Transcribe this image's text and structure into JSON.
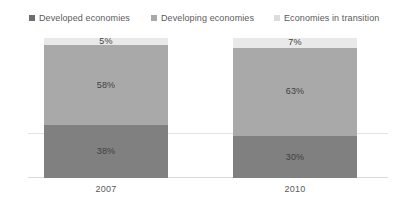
{
  "chart_data": {
    "type": "bar",
    "subtype": "100%-stacked-bar",
    "title": "",
    "subtitle": "",
    "xlabel": "",
    "ylabel": "",
    "categories": [
      "2007",
      "2010"
    ],
    "series": [
      {
        "name": "Developed economies",
        "values": [
          38,
          30
        ],
        "labels": [
          "38%",
          "30%"
        ],
        "color": "#808080",
        "swatch_color": "#6e6e6e"
      },
      {
        "name": "Developing economies",
        "values": [
          58,
          63
        ],
        "labels": [
          "58%",
          "63%"
        ],
        "color": "#a9a9a9",
        "swatch_color": "#a9a9a9"
      },
      {
        "name": "Economies in transition",
        "values": [
          5,
          7
        ],
        "labels": [
          "5%",
          "7%"
        ],
        "color": "#e9e9e9",
        "swatch_color": "#dcdcdc"
      }
    ],
    "stack_order_top_to_bottom": [
      "Economies in transition",
      "Developing economies",
      "Developed economies"
    ],
    "ylim": [
      0,
      100
    ],
    "grid": true,
    "gridlines_at": [
      50
    ],
    "legend_position": "top",
    "value_unit": "%"
  },
  "legend": {
    "items": [
      {
        "label": "Developed economies"
      },
      {
        "label": "Developing economies"
      },
      {
        "label": "Economies in transition"
      }
    ]
  },
  "colors": {
    "developed": "#808080",
    "developing": "#a9a9a9",
    "transition": "#e9e9e9",
    "gridline": "#e4e4e4",
    "axis": "#d9d9d9",
    "text": "#5a5a5a",
    "label_text": "#3f3f3f",
    "background": "#ffffff"
  }
}
